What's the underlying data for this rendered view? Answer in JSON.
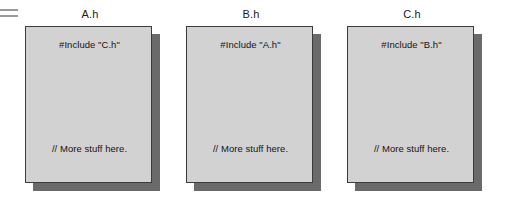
{
  "diagram": {
    "title": "",
    "background_color": "#ffffff",
    "marker": {
      "name": "equals-marker",
      "description": "two thin horizontal gray rules at top-left",
      "color": "#9a9a9a"
    },
    "card_style": {
      "fill_color": "#d2d2d2",
      "border_color": "#3c3c3c",
      "shadow_color": "#6a6a6a"
    },
    "files": [
      {
        "title": "A.h",
        "include_line": "#Include \"C.h\"",
        "comment_line": "// More stuff here."
      },
      {
        "title": "B.h",
        "include_line": "#Include \"A.h\"",
        "comment_line": "// More stuff here."
      },
      {
        "title": "C.h",
        "include_line": "#Include \"B.h\"",
        "comment_line": "// More stuff here."
      }
    ]
  }
}
